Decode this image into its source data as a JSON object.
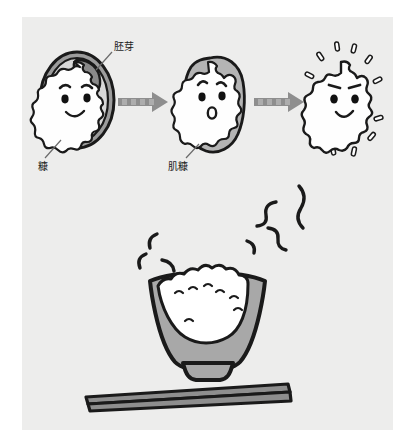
{
  "figure": {
    "panel_background": "#ededec",
    "page_background": "#ffffff"
  },
  "labels": {
    "germ": "胚芽",
    "bran": "糠",
    "inner_bran": "肌糠"
  },
  "stages": [
    {
      "id": "brown-rice",
      "name": "brown-rice-grain",
      "has_husk": true,
      "has_germ": true,
      "face": "smiling",
      "label_ids": [
        "germ",
        "bran"
      ]
    },
    {
      "id": "partially-milled-rice",
      "name": "partially-milled-rice-grain",
      "has_husk": false,
      "has_germ": false,
      "face": "surprised",
      "label_ids": [
        "inner_bran"
      ]
    },
    {
      "id": "white-rice",
      "name": "white-polished-rice-grain",
      "has_husk": false,
      "has_germ": false,
      "face": "smiling",
      "sparkles": 12,
      "label_ids": []
    }
  ],
  "arrows": [
    {
      "name": "arrow-stage-1-to-2"
    },
    {
      "name": "arrow-stage-2-to-3"
    }
  ],
  "bowl": {
    "name": "rice-bowl",
    "contents": "cooked-white-rice",
    "steam_strokes": 7
  },
  "chopsticks": {
    "name": "chopsticks-pair",
    "count": 2
  },
  "colors": {
    "outline": "#1a1a1a",
    "husk_fill": "#9c9c9c",
    "germ_fill": "#8a8a8a",
    "grain_fill": "#fefefe",
    "arrow_fill": "#8e8e8e",
    "bowl_fill": "#a8a8a8",
    "rice_fill": "#ffffff",
    "chopstick_fill": "#8e8e8e",
    "panel_bg": "#ededec",
    "text": "#1d1d1d"
  }
}
